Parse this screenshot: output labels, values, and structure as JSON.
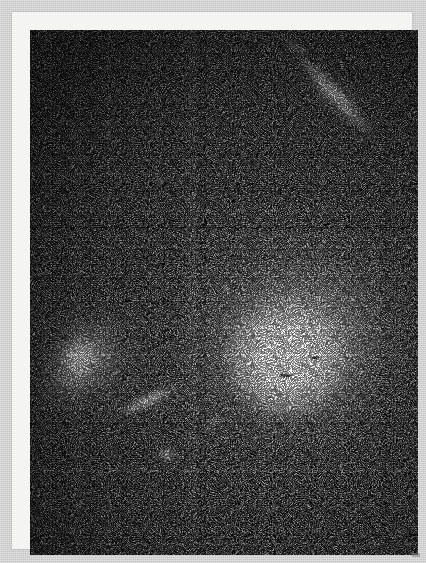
{
  "figure": {
    "domain": "Natural-Image",
    "width_px": 426,
    "height_px": 563,
    "caption": "",
    "title": "",
    "visible_text": []
  },
  "colors": {
    "paper_margin": "#d3d3d3",
    "photo_frame": "#f4f4f2",
    "sky_background": "#070707",
    "star_white": "#ffffff",
    "halo_gray": "#c8c8c8",
    "noise_gray": "#5a5a5a"
  },
  "plate": {
    "left": 18,
    "top": 18,
    "width": 388,
    "height": 525,
    "frame": {
      "left": 12,
      "top": 12,
      "width": 400,
      "height": 537,
      "border_px": 6
    }
  },
  "objects": [
    {
      "id": "primary-elliptical",
      "name": "dominant elliptical galaxy",
      "type": "elliptical",
      "center_x": 265,
      "center_y": 345,
      "core_brightness": "saturated-white",
      "halo_radius_px": 165,
      "position_angle_deg": -20
    },
    {
      "id": "companion-left",
      "name": "companion elliptical galaxy",
      "type": "elliptical",
      "center_x": 58,
      "center_y": 345,
      "core_brightness": "bright",
      "halo_radius_px": 64,
      "position_angle_deg": 32
    },
    {
      "id": "edge-on-ne",
      "name": "edge-on disk galaxy, upper right",
      "type": "edge-on-spiral",
      "center_x": 306,
      "center_y": 84,
      "length_px": 108,
      "position_angle_deg": 47
    },
    {
      "id": "faint-streak-top",
      "name": "faint streak near top edge",
      "type": "edge-on-spiral",
      "center_x": 285,
      "center_y": 37,
      "length_px": 38,
      "position_angle_deg": 32
    },
    {
      "id": "edge-on-sw",
      "name": "edge-on disk galaxy, lower left",
      "type": "edge-on-spiral",
      "center_x": 136,
      "center_y": 389,
      "length_px": 72,
      "position_angle_deg": -24
    },
    {
      "id": "faint-streak-mid",
      "name": "faint streak right of lower-left disk",
      "type": "edge-on-spiral",
      "center_x": 203,
      "center_y": 410,
      "length_px": 34,
      "position_angle_deg": -16
    },
    {
      "id": "compact-knot",
      "name": "compact knot below companion",
      "type": "compact-source",
      "center_x": 156,
      "center_y": 443,
      "length_px": 19,
      "position_angle_deg": 0
    }
  ],
  "point_sources": [
    {
      "x": 214,
      "y": 276,
      "size": 5
    },
    {
      "x": 148,
      "y": 168,
      "size": 4
    },
    {
      "x": 360,
      "y": 252,
      "size": 4
    },
    {
      "x": 96,
      "y": 110,
      "size": 3
    },
    {
      "x": 330,
      "y": 452,
      "size": 4
    },
    {
      "x": 252,
      "y": 472,
      "size": 3
    },
    {
      "x": 62,
      "y": 482,
      "size": 3
    },
    {
      "x": 386,
      "y": 170,
      "size": 3
    },
    {
      "x": 178,
      "y": 90,
      "size": 3
    },
    {
      "x": 300,
      "y": 400,
      "size": 3
    }
  ],
  "dark_specks": [
    {
      "x": 268,
      "y": 362,
      "w": 11,
      "h": 3
    },
    {
      "x": 300,
      "y": 344,
      "w": 8,
      "h": 3
    }
  ]
}
